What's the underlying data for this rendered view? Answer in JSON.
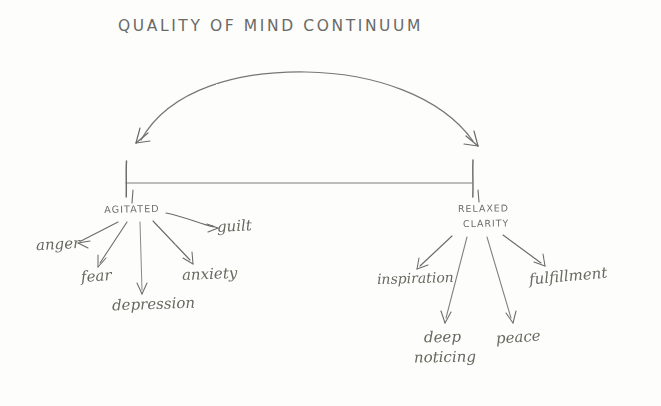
{
  "title": "QUALITY OF MIND CONTINUUM",
  "continuum": {
    "left_pole": "AGITATED",
    "right_pole_line1": "RELAXED",
    "right_pole_line2": "CLARITY"
  },
  "agitated_states": [
    {
      "label": "anger"
    },
    {
      "label": "fear"
    },
    {
      "label": "depression"
    },
    {
      "label": "anxiety"
    },
    {
      "label": "guilt"
    }
  ],
  "relaxed_states": [
    {
      "label": "inspiration"
    },
    {
      "label": "deep"
    },
    {
      "label": "noticing"
    },
    {
      "label": "peace"
    },
    {
      "label": "fulfillment"
    }
  ],
  "colors": {
    "background": "#fdfdfc",
    "ink": "#6b6b68",
    "ink_dark": "#5a5a56"
  }
}
